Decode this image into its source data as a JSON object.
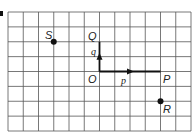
{
  "figure": {
    "part_label": "a",
    "grid": {
      "cols": 12,
      "rows": 8,
      "line_color": "#555555",
      "bg": "#ffffff"
    },
    "points": [
      {
        "name": "O",
        "col": 6,
        "row": 4,
        "dot": false
      },
      {
        "name": "P",
        "col": 10,
        "row": 4,
        "dot": false
      },
      {
        "name": "Q",
        "col": 6,
        "row": 2,
        "dot": false
      },
      {
        "name": "S",
        "col": 3,
        "row": 2,
        "dot": true
      },
      {
        "name": "R",
        "col": 10,
        "row": 6,
        "dot": true
      }
    ],
    "vectors": [
      {
        "name": "p",
        "from": "O",
        "to": "P",
        "label": "p"
      },
      {
        "name": "q",
        "from": "O",
        "to": "Q",
        "label": "q"
      }
    ],
    "labels": {
      "O": "O",
      "P": "P",
      "Q": "Q",
      "S": "S",
      "R": "R",
      "p": "p",
      "q": "q"
    }
  }
}
